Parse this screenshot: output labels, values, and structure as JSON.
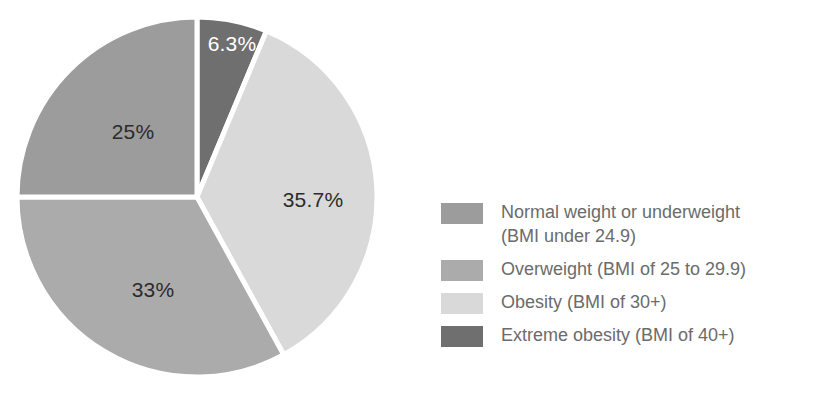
{
  "chart_data": {
    "type": "pie",
    "title": "",
    "subtitle": "",
    "xlabel": "",
    "ylabel": "",
    "grid": false,
    "legend_position": "right",
    "start_angle_deg": 0,
    "direction": "clockwise",
    "categories": [
      "Normal weight or underweight (BMI under 24.9)",
      "Overweight (BMI of 25 to 29.9)",
      "Obesity (BMI of 30+)",
      "Extreme obesity (BMI of 40+)"
    ],
    "values": [
      25,
      33,
      35.7,
      6.3
    ],
    "value_labels": [
      "25%",
      "33%",
      "35.7%",
      "6.3%"
    ],
    "colors": [
      "#9c9c9c",
      "#ababab",
      "#d9d9d9",
      "#6f6f6f"
    ],
    "slices": [
      {
        "name": "Extreme obesity (BMI of 40+)",
        "value": 6.3,
        "label": "6.3%",
        "color": "#6f6f6f",
        "label_color": "#ffffff",
        "start_deg": 0,
        "end_deg": 22.68,
        "label_x": 232,
        "label_y": 45
      },
      {
        "name": "Obesity (BMI of 30+)",
        "value": 35.7,
        "label": "35.7%",
        "color": "#d9d9d9",
        "label_color": "#2b2b2b",
        "start_deg": 22.68,
        "end_deg": 151.2,
        "label_x": 313,
        "label_y": 201
      },
      {
        "name": "Overweight (BMI of 25 to 29.9)",
        "value": 33,
        "label": "33%",
        "color": "#ababab",
        "label_color": "#2b2b2b",
        "start_deg": 151.2,
        "end_deg": 270,
        "label_x": 153,
        "label_y": 291
      },
      {
        "name": "Normal weight or underweight (BMI under 24.9)",
        "value": 25,
        "label": "25%",
        "color": "#9c9c9c",
        "label_color": "#2b2b2b",
        "start_deg": 270,
        "end_deg": 360,
        "label_x": 133,
        "label_y": 133
      }
    ]
  },
  "legend": {
    "items": [
      {
        "label": "Normal weight or underweight\n(BMI under 24.9)",
        "color": "#9c9c9c"
      },
      {
        "label": "Overweight (BMI of 25 to 29.9)",
        "color": "#ababab"
      },
      {
        "label": "Obesity (BMI of 30+)",
        "color": "#d9d9d9"
      },
      {
        "label": "Extreme obesity (BMI of 40+)",
        "color": "#6f6f6f"
      }
    ]
  }
}
